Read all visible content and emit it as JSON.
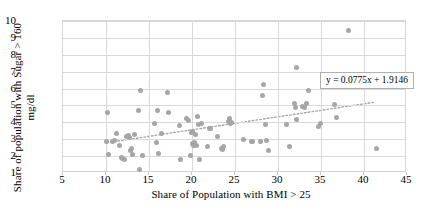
{
  "chart_data": {
    "type": "scatter",
    "title": "",
    "xlabel": "Share of Population with BMI > 25",
    "ylabel": "Share of population with Sugar > 160\nmg/dl",
    "xlim": [
      5,
      45
    ],
    "ylim": [
      1,
      10
    ],
    "xticks": [
      5,
      10,
      15,
      20,
      25,
      30,
      35,
      40,
      45
    ],
    "yticks": [
      1,
      2,
      3,
      4,
      5,
      6,
      7,
      8,
      9,
      10
    ],
    "grid": true,
    "legend": "none",
    "marker_color": "#a6a6a6",
    "trendline": {
      "style": "dotted",
      "color": "#a6a6a6",
      "slope": 0.0775,
      "intercept": 1.9146,
      "equation_label": "y = 0.0775x + 1.9146"
    },
    "points": [
      [
        10.1,
        2.88
      ],
      [
        10.2,
        4.58
      ],
      [
        10.3,
        2.07
      ],
      [
        10.8,
        2.87
      ],
      [
        11.0,
        2.9
      ],
      [
        11.2,
        3.35
      ],
      [
        11.6,
        2.6
      ],
      [
        11.8,
        1.92
      ],
      [
        11.9,
        1.85
      ],
      [
        12.1,
        1.8
      ],
      [
        12.4,
        3.18
      ],
      [
        12.6,
        3.22
      ],
      [
        12.7,
        3.1
      ],
      [
        12.9,
        2.35
      ],
      [
        13.0,
        2.44
      ],
      [
        13.1,
        2.08
      ],
      [
        13.3,
        3.28
      ],
      [
        13.8,
        4.68
      ],
      [
        13.9,
        1.18
      ],
      [
        14.0,
        5.88
      ],
      [
        14.2,
        2.06
      ],
      [
        15.6,
        3.96
      ],
      [
        15.9,
        2.8
      ],
      [
        16.0,
        4.68
      ],
      [
        16.1,
        2.13
      ],
      [
        16.4,
        3.34
      ],
      [
        17.1,
        5.76
      ],
      [
        17.3,
        4.56
      ],
      [
        18.5,
        3.8
      ],
      [
        18.7,
        1.78
      ],
      [
        19.4,
        4.22
      ],
      [
        19.6,
        4.12
      ],
      [
        19.8,
        2.06
      ],
      [
        19.9,
        3.4
      ],
      [
        20.0,
        3.46
      ],
      [
        20.1,
        2.72
      ],
      [
        20.2,
        2.64
      ],
      [
        20.3,
        2.8
      ],
      [
        20.4,
        3.3
      ],
      [
        20.5,
        2.62
      ],
      [
        20.6,
        4.34
      ],
      [
        20.8,
        3.88
      ],
      [
        20.9,
        1.78
      ],
      [
        21.1,
        3.92
      ],
      [
        21.8,
        2.58
      ],
      [
        22.0,
        3.62
      ],
      [
        22.2,
        3.66
      ],
      [
        23.0,
        3.14
      ],
      [
        23.4,
        2.46
      ],
      [
        23.6,
        2.42
      ],
      [
        23.7,
        2.56
      ],
      [
        24.3,
        4.04
      ],
      [
        24.4,
        4.22
      ],
      [
        24.5,
        3.96
      ],
      [
        24.6,
        4.0
      ],
      [
        26.0,
        2.96
      ],
      [
        26.9,
        2.86
      ],
      [
        27.0,
        2.88
      ],
      [
        28.0,
        2.86
      ],
      [
        28.2,
        5.56
      ],
      [
        28.3,
        6.22
      ],
      [
        28.5,
        3.88
      ],
      [
        28.7,
        2.92
      ],
      [
        28.9,
        2.36
      ],
      [
        31.0,
        3.86
      ],
      [
        31.3,
        2.56
      ],
      [
        31.9,
        5.12
      ],
      [
        32.0,
        4.86
      ],
      [
        32.1,
        4.16
      ],
      [
        32.2,
        7.24
      ],
      [
        32.9,
        4.92
      ],
      [
        33.1,
        4.88
      ],
      [
        33.3,
        5.1
      ],
      [
        33.5,
        5.88
      ],
      [
        34.7,
        3.78
      ],
      [
        34.9,
        3.92
      ],
      [
        36.6,
        5.04
      ],
      [
        36.8,
        4.3
      ],
      [
        38.2,
        9.45
      ],
      [
        41.5,
        2.45
      ]
    ]
  }
}
